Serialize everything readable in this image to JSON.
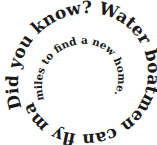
{
  "spiral": {
    "full_text": "Did you know? Water boatmen can fly many miles to find a new home.",
    "outer_text": "Did you know? Water boatmen can fly many",
    "inner_text": "miles to find a new home.",
    "text_color": "#1a1a1a",
    "background": "#ffffff"
  }
}
